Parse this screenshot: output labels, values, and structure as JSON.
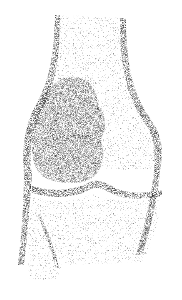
{
  "image": {
    "subject": "stippled anatomical illustration of a knee joint",
    "width": 182,
    "height": 300,
    "background": "#ffffff",
    "ink_color": "#1a1a1a",
    "structures": [
      "femur-shaft",
      "cortical-walls",
      "lobulated-lesion",
      "joint-space",
      "tibia"
    ]
  }
}
